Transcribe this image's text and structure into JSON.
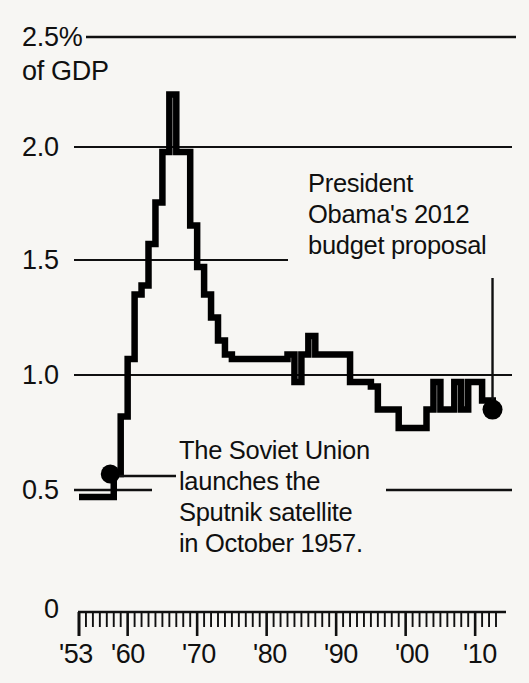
{
  "chart_data": {
    "type": "line",
    "title": "",
    "subtitle": "",
    "xlabel": "",
    "ylabel": "2.5% of GDP",
    "y_axis_unit": "% of GDP",
    "ylim": [
      0,
      2.5
    ],
    "xlim": [
      1953,
      2013
    ],
    "grid": true,
    "grid_lines": [
      "2.5",
      "2.0",
      "1.5",
      "1.0",
      "0.5"
    ],
    "y_ticks": [
      {
        "label": "2.5%",
        "value": 2.5
      },
      {
        "label": "2.0",
        "value": 2.0
      },
      {
        "label": "1.5",
        "value": 1.5
      },
      {
        "label": "1.0",
        "value": 1.0
      },
      {
        "label": "0.5",
        "value": 0.5
      },
      {
        "label": "0",
        "value": 0
      }
    ],
    "y_tick_sublabel": "of GDP",
    "x_ticks": [
      {
        "label": "'53",
        "value": 1953
      },
      {
        "label": "'60",
        "value": 1960
      },
      {
        "label": "'70",
        "value": 1970
      },
      {
        "label": "'80",
        "value": 1980
      },
      {
        "label": "'90",
        "value": 1990
      },
      {
        "label": "'00",
        "value": 2000
      },
      {
        "label": "'10",
        "value": 2010
      }
    ],
    "x_minor_tick_interval": 1,
    "series": [
      {
        "name": "NASA budget as share of GDP",
        "x": [
          1953,
          1954,
          1955,
          1956,
          1957,
          1958,
          1959,
          1960,
          1961,
          1962,
          1963,
          1964,
          1965,
          1966,
          1967,
          1968,
          1969,
          1970,
          1971,
          1972,
          1973,
          1974,
          1975,
          1976,
          1977,
          1978,
          1979,
          1980,
          1981,
          1982,
          1983,
          1984,
          1985,
          1986,
          1987,
          1988,
          1989,
          1990,
          1991,
          1992,
          1993,
          1994,
          1995,
          1996,
          1997,
          1998,
          1999,
          2000,
          2001,
          2002,
          2003,
          2004,
          2005,
          2006,
          2007,
          2008,
          2009,
          2010,
          2011,
          2012
        ],
        "values": [
          0.5,
          0.5,
          0.5,
          0.5,
          0.5,
          0.6,
          0.85,
          1.1,
          1.38,
          1.42,
          1.6,
          1.78,
          2.0,
          2.25,
          2.0,
          2.0,
          1.68,
          1.5,
          1.38,
          1.28,
          1.18,
          1.12,
          1.1,
          1.1,
          1.1,
          1.1,
          1.1,
          1.1,
          1.1,
          1.1,
          1.12,
          1.0,
          1.12,
          1.2,
          1.12,
          1.12,
          1.12,
          1.12,
          1.12,
          1.0,
          1.0,
          1.0,
          0.98,
          0.88,
          0.88,
          0.88,
          0.8,
          0.8,
          0.8,
          0.8,
          0.88,
          1.0,
          0.88,
          0.88,
          1.0,
          0.88,
          1.0,
          1.0,
          0.92,
          0.92
        ]
      }
    ],
    "markers": [
      {
        "name": "sputnik-marker",
        "x": 1957,
        "y": 0.6
      },
      {
        "name": "obama-proposal-marker",
        "x": 2012,
        "y": 0.88
      }
    ],
    "annotations": [
      {
        "name": "obama-budget-annotation",
        "lines": [
          "President",
          "Obama's 2012",
          "budget proposal"
        ],
        "leader": "vertical line to marker at 2012"
      },
      {
        "name": "sputnik-annotation",
        "lines": [
          "The Soviet Union",
          "launches the",
          "Sputnik satellite",
          "in October 1957."
        ],
        "leader": "horizontal line to marker at 1957"
      }
    ]
  },
  "axis_labels": {
    "y25": "2.5%",
    "y_unit": "of GDP",
    "y20": "2.0",
    "y15": "1.5",
    "y10": "1.0",
    "y05": "0.5",
    "y00": "0",
    "x53": "'53",
    "x60": "'60",
    "x70": "'70",
    "x80": "'80",
    "x90": "'90",
    "x00": "'00",
    "x10": "'10"
  },
  "annotation_text": {
    "obama_line1": "President",
    "obama_line2": "Obama's 2012",
    "obama_line3": "budget proposal",
    "sputnik_line1": "The Soviet Union",
    "sputnik_line2": "launches the",
    "sputnik_line3": "Sputnik satellite",
    "sputnik_line4": "in October 1957."
  },
  "colors": {
    "background": "#f7f6f3",
    "ink": "#101010",
    "gridline": "#1a1a1a",
    "data_line": "#000000"
  }
}
